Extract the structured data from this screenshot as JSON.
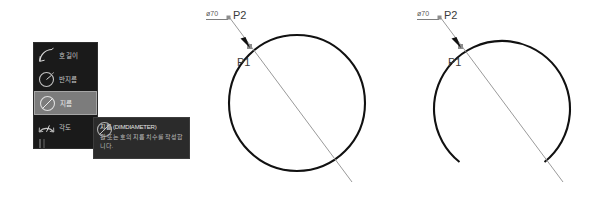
{
  "menu": {
    "items": [
      {
        "label": "호 길이",
        "icon": "arc-length-icon",
        "selected": false,
        "partial": false
      },
      {
        "label": "반지름",
        "icon": "radius-icon",
        "selected": false,
        "partial": false
      },
      {
        "label": "지름",
        "icon": "diameter-icon",
        "selected": true,
        "partial": false
      },
      {
        "label": "각도",
        "icon": "angle-icon",
        "selected": false,
        "partial": false
      },
      {
        "label": "",
        "icon": "ordinate-icon",
        "selected": false,
        "partial": true
      }
    ]
  },
  "tooltip": {
    "title": "지름 (DIMDIAMETER)",
    "body": "원 또는 호의 지름 치수를 작성합니다."
  },
  "figures": {
    "circle": {
      "name": "circle-diagram",
      "dimension_text": "ø70",
      "point_labels": {
        "p1": "P1",
        "p2": "P2"
      }
    },
    "arc": {
      "name": "arc-diagram",
      "dimension_text": "ø70",
      "point_labels": {
        "p1": "P1",
        "p2": "P2"
      }
    }
  },
  "colors": {
    "stroke_dark": "#111111",
    "leader_gray": "#9a9a9a",
    "panel_bg": "#1a1a1a",
    "panel_selected": "#7c7c7c",
    "tooltip_bg": "#2b2b2b",
    "label_gray": "#3b3b3b"
  }
}
